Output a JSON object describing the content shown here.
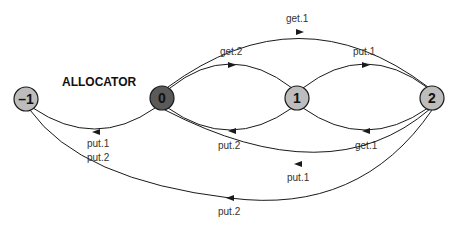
{
  "diagram": {
    "title": "ALLOCATOR",
    "colors": {
      "initial_node_fill": "#5a5a5a",
      "node_fill": "#bdbdbd",
      "node_stroke": "#1a1a1a",
      "edge": "#1a1a1a",
      "label": "#333333"
    },
    "nodes": [
      {
        "id": "-1",
        "label": "–1"
      },
      {
        "id": "0",
        "label": "0"
      },
      {
        "id": "1",
        "label": "1"
      },
      {
        "id": "2",
        "label": "2"
      }
    ],
    "edges": [
      {
        "from": "0",
        "to": "2",
        "label": "get.1"
      },
      {
        "from": "0",
        "to": "1",
        "label": "get.2"
      },
      {
        "from": "1",
        "to": "2",
        "label": "put.1"
      },
      {
        "from": "0",
        "to": "-1",
        "label_line1": "put.1",
        "label_line2": "put.2"
      },
      {
        "from": "1",
        "to": "0",
        "label": "put.2"
      },
      {
        "from": "2",
        "to": "1",
        "label": "get.1"
      },
      {
        "from": "2",
        "to": "0",
        "label": "put.1"
      },
      {
        "from": "2",
        "to": "-1",
        "label": "put.2"
      }
    ]
  }
}
